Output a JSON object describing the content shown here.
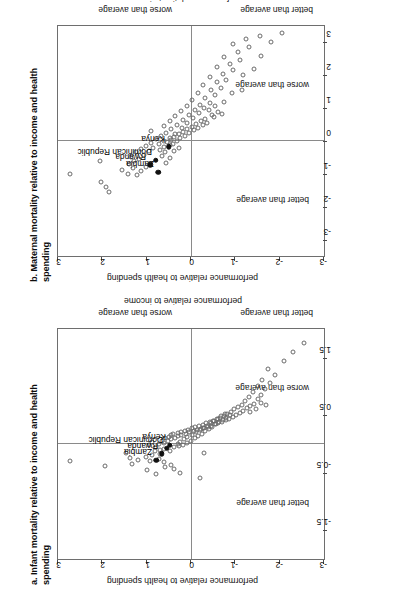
{
  "figure": {
    "orientation": "rotated-90-ccw",
    "background": "#ffffff",
    "point_stroke": "#6b6b6b",
    "highlight_fill": "#111111",
    "axis_color": "#6e6e6e"
  },
  "chart_data": [
    {
      "type": "scatter",
      "id": "panel-a",
      "title": "a. Infant mortality relative to income and health spending",
      "xlabel": "performance relative to income",
      "ylabel": "performance relative to health spending",
      "xlim": [
        -2.0,
        2.0
      ],
      "ylim": [
        -3.0,
        3.0
      ],
      "xticks": [
        -1.5,
        -0.5,
        0.5,
        1.5
      ],
      "xticklabels": [
        "-1.5",
        "-0.5",
        "0.5",
        "1.5"
      ],
      "yticks": [
        -3,
        -2,
        -1,
        0,
        1,
        2,
        3
      ],
      "yticklabels": [
        "-3",
        "-2",
        "-1",
        "0",
        "1",
        "2",
        "3"
      ],
      "grid": false,
      "zero_lines": true,
      "quadrant_notes": {
        "x_negative": "better than average",
        "x_positive": "worse than average",
        "y_negative": "better than average",
        "y_positive": "worse than average"
      },
      "highlighted": [
        {
          "label": "Zambia",
          "x": -0.28,
          "y": 0.78
        },
        {
          "label": "Rwanda",
          "x": -0.17,
          "y": 0.66
        },
        {
          "label": "Dominican Republic",
          "x": -0.07,
          "y": 0.55
        },
        {
          "label": "Kenya",
          "x": -0.02,
          "y": 0.48
        }
      ],
      "points": [
        [
          -0.3,
          2.72
        ],
        [
          -0.38,
          1.93
        ],
        [
          -0.16,
          1.46
        ],
        [
          -0.24,
          1.38
        ],
        [
          -0.34,
          1.33
        ],
        [
          -0.28,
          1.2
        ],
        [
          -0.45,
          1.0
        ],
        [
          -0.52,
          0.8
        ],
        [
          -0.3,
          0.93
        ],
        [
          -0.22,
          1.02
        ],
        [
          -0.2,
          0.88
        ],
        [
          -0.26,
          0.72
        ],
        [
          -0.18,
          0.7
        ],
        [
          -0.13,
          0.82
        ],
        [
          -0.1,
          0.7
        ],
        [
          -0.08,
          0.6
        ],
        [
          -0.05,
          0.8
        ],
        [
          -0.02,
          0.95
        ],
        [
          0.0,
          0.72
        ],
        [
          0.02,
          0.6
        ],
        [
          0.03,
          0.88
        ],
        [
          0.05,
          0.52
        ],
        [
          0.06,
          0.66
        ],
        [
          0.08,
          0.44
        ],
        [
          0.1,
          0.58
        ],
        [
          0.11,
          0.36
        ],
        [
          0.12,
          0.5
        ],
        [
          0.14,
          0.3
        ],
        [
          0.15,
          0.44
        ],
        [
          0.16,
          0.22
        ],
        [
          0.17,
          0.4
        ],
        [
          0.18,
          0.12
        ],
        [
          0.19,
          0.3
        ],
        [
          0.2,
          0.04
        ],
        [
          0.21,
          0.22
        ],
        [
          0.22,
          -0.06
        ],
        [
          0.23,
          0.14
        ],
        [
          0.24,
          -0.14
        ],
        [
          0.25,
          0.06
        ],
        [
          0.26,
          -0.22
        ],
        [
          0.27,
          -0.02
        ],
        [
          0.28,
          -0.3
        ],
        [
          0.29,
          -0.1
        ],
        [
          0.3,
          -0.38
        ],
        [
          0.31,
          -0.18
        ],
        [
          0.32,
          -0.46
        ],
        [
          0.33,
          -0.26
        ],
        [
          0.34,
          -0.54
        ],
        [
          0.36,
          -0.34
        ],
        [
          0.37,
          -0.62
        ],
        [
          0.38,
          -0.42
        ],
        [
          0.39,
          -0.7
        ],
        [
          0.4,
          -0.5
        ],
        [
          0.41,
          -0.78
        ],
        [
          0.43,
          -0.58
        ],
        [
          0.44,
          -0.86
        ],
        [
          0.45,
          -0.66
        ],
        [
          0.47,
          -0.94
        ],
        [
          0.48,
          -0.74
        ],
        [
          0.5,
          -1.02
        ],
        [
          0.52,
          -0.82
        ],
        [
          0.54,
          -1.1
        ],
        [
          0.56,
          -0.9
        ],
        [
          0.58,
          -1.18
        ],
        [
          0.6,
          -0.98
        ],
        [
          0.62,
          -1.26
        ],
        [
          0.64,
          -1.06
        ],
        [
          0.66,
          -1.34
        ],
        [
          0.68,
          -1.14
        ],
        [
          0.7,
          -1.42
        ],
        [
          0.74,
          -1.22
        ],
        [
          0.78,
          -1.5
        ],
        [
          0.82,
          -1.3
        ],
        [
          0.86,
          -1.58
        ],
        [
          0.9,
          -1.4
        ],
        [
          0.95,
          -1.66
        ],
        [
          1.0,
          -1.5
        ],
        [
          1.06,
          -1.78
        ],
        [
          1.12,
          -1.6
        ],
        [
          1.2,
          -1.9
        ],
        [
          1.3,
          -1.74
        ],
        [
          1.45,
          -2.1
        ],
        [
          1.6,
          -2.3
        ],
        [
          1.75,
          -2.55
        ],
        [
          -0.06,
          0.38
        ],
        [
          -0.04,
          0.26
        ],
        [
          -0.02,
          0.18
        ],
        [
          0.0,
          0.3
        ],
        [
          0.02,
          0.1
        ],
        [
          0.04,
          0.24
        ],
        [
          0.06,
          0.0
        ],
        [
          0.08,
          0.16
        ],
        [
          0.1,
          -0.08
        ],
        [
          0.12,
          0.08
        ],
        [
          0.14,
          -0.16
        ],
        [
          0.16,
          -0.02
        ],
        [
          0.18,
          -0.24
        ],
        [
          0.2,
          -0.12
        ],
        [
          0.22,
          -0.32
        ],
        [
          0.24,
          -0.2
        ],
        [
          0.26,
          -0.4
        ],
        [
          0.28,
          -0.28
        ],
        [
          0.3,
          -0.48
        ],
        [
          0.32,
          -0.36
        ],
        [
          0.34,
          -0.56
        ],
        [
          0.36,
          -0.44
        ],
        [
          0.38,
          -0.64
        ],
        [
          0.4,
          -0.52
        ],
        [
          0.42,
          -0.72
        ],
        [
          0.44,
          -0.6
        ],
        [
          0.46,
          -0.8
        ],
        [
          0.48,
          -0.68
        ],
        [
          0.5,
          -0.88
        ],
        [
          0.52,
          -0.76
        ],
        [
          -0.4,
          0.58
        ],
        [
          -0.36,
          0.46
        ],
        [
          -0.32,
          0.62
        ],
        [
          -0.12,
          0.48
        ],
        [
          -0.44,
          0.38
        ],
        [
          -0.5,
          0.25
        ],
        [
          -0.6,
          -0.2
        ],
        [
          -0.15,
          -0.3
        ],
        [
          0.55,
          -1.34
        ],
        [
          0.6,
          -1.46
        ],
        [
          0.68,
          -1.7
        ],
        [
          0.72,
          -1.58
        ]
      ]
    },
    {
      "type": "scatter",
      "id": "panel-b",
      "title": "b. Maternal mortality relative to income and health spending",
      "xlabel": "performance relative to income",
      "ylabel": "performance relative to health spending",
      "xlim": [
        -3.5,
        3.5
      ],
      "ylim": [
        -3.0,
        3.0
      ],
      "xticks": [
        -3,
        -2,
        -1,
        0,
        1,
        2,
        3
      ],
      "xticklabels": [
        "-3",
        "-2",
        "-1",
        "0",
        "1",
        "2",
        "3"
      ],
      "yticks": [
        -3,
        -2,
        -1,
        0,
        1,
        2,
        3
      ],
      "yticklabels": [
        "-3",
        "-2",
        "-1",
        "0",
        "1",
        "2",
        "3"
      ],
      "grid": false,
      "zero_lines": true,
      "quadrant_notes": {
        "x_negative": "better than average",
        "x_positive": "worse than average",
        "y_negative": "better than average",
        "y_positive": "worse than average"
      },
      "highlighted": [
        {
          "label": "Zambia",
          "x": -0.95,
          "y": 0.74
        },
        {
          "label": "Rwanda",
          "x": -0.72,
          "y": 0.92
        },
        {
          "label": "Dominican Republic",
          "x": -0.58,
          "y": 0.8
        },
        {
          "label": "Kenya",
          "x": -0.18,
          "y": 0.5
        }
      ],
      "points": [
        [
          -1.0,
          2.72
        ],
        [
          -1.25,
          2.02
        ],
        [
          -1.4,
          1.92
        ],
        [
          -1.55,
          1.85
        ],
        [
          -0.6,
          2.06
        ],
        [
          -0.88,
          1.55
        ],
        [
          -1.0,
          1.42
        ],
        [
          -0.82,
          1.3
        ],
        [
          -1.05,
          1.22
        ],
        [
          -0.92,
          1.12
        ],
        [
          -0.7,
          1.4
        ],
        [
          -0.62,
          1.28
        ],
        [
          -0.78,
          1.02
        ],
        [
          -0.55,
          1.18
        ],
        [
          -0.48,
          1.35
        ],
        [
          -0.42,
          1.05
        ],
        [
          -0.35,
          1.24
        ],
        [
          -0.3,
          0.95
        ],
        [
          -0.25,
          1.12
        ],
        [
          -0.2,
          0.85
        ],
        [
          -0.15,
          1.02
        ],
        [
          -0.1,
          0.72
        ],
        [
          -0.05,
          0.9
        ],
        [
          0.0,
          0.6
        ],
        [
          0.05,
          0.8
        ],
        [
          0.1,
          0.48
        ],
        [
          0.15,
          0.68
        ],
        [
          0.2,
          0.36
        ],
        [
          0.25,
          0.56
        ],
        [
          0.3,
          0.9
        ],
        [
          0.35,
          0.44
        ],
        [
          0.4,
          0.2
        ],
        [
          0.45,
          0.62
        ],
        [
          0.5,
          0.32
        ],
        [
          0.55,
          0.08
        ],
        [
          0.6,
          0.48
        ],
        [
          0.65,
          0.18
        ],
        [
          0.7,
          -0.05
        ],
        [
          0.75,
          0.36
        ],
        [
          0.8,
          0.05
        ],
        [
          0.85,
          -0.18
        ],
        [
          0.9,
          0.22
        ],
        [
          0.95,
          -0.08
        ],
        [
          1.0,
          -0.3
        ],
        [
          1.05,
          0.1
        ],
        [
          1.1,
          -0.2
        ],
        [
          1.15,
          -0.42
        ],
        [
          1.25,
          -0.02
        ],
        [
          1.3,
          -0.32
        ],
        [
          1.4,
          -0.55
        ],
        [
          1.45,
          -0.15
        ],
        [
          1.55,
          -0.45
        ],
        [
          1.6,
          -0.68
        ],
        [
          1.7,
          -0.28
        ],
        [
          1.8,
          -0.58
        ],
        [
          1.85,
          -0.8
        ],
        [
          1.95,
          -0.42
        ],
        [
          2.05,
          -0.72
        ],
        [
          2.15,
          -0.95
        ],
        [
          2.25,
          -0.58
        ],
        [
          2.35,
          -0.88
        ],
        [
          2.45,
          -1.1
        ],
        [
          2.55,
          -0.75
        ],
        [
          2.7,
          -1.05
        ],
        [
          2.85,
          -1.3
        ],
        [
          2.95,
          -0.95
        ],
        [
          3.1,
          -1.25
        ],
        [
          3.2,
          -1.55
        ],
        [
          1.45,
          -0.92
        ],
        [
          1.55,
          -1.15
        ],
        [
          1.2,
          -0.75
        ],
        [
          1.05,
          -0.55
        ],
        [
          0.95,
          -0.4
        ],
        [
          0.88,
          -0.62
        ],
        [
          0.78,
          -0.48
        ],
        [
          -0.18,
          0.62
        ],
        [
          -0.12,
          0.48
        ],
        [
          -0.08,
          0.4
        ],
        [
          -0.04,
          0.55
        ],
        [
          0.0,
          0.32
        ],
        [
          0.04,
          0.46
        ],
        [
          0.08,
          0.24
        ],
        [
          0.12,
          0.38
        ],
        [
          0.16,
          0.14
        ],
        [
          0.2,
          0.28
        ],
        [
          0.24,
          0.04
        ],
        [
          0.28,
          0.18
        ],
        [
          0.32,
          -0.06
        ],
        [
          0.36,
          0.08
        ],
        [
          0.4,
          -0.16
        ],
        [
          0.44,
          -0.02
        ],
        [
          0.48,
          -0.26
        ],
        [
          0.52,
          -0.12
        ],
        [
          0.56,
          -0.36
        ],
        [
          0.6,
          -0.22
        ],
        [
          -0.26,
          0.7
        ],
        [
          -0.34,
          0.58
        ],
        [
          -0.45,
          0.66
        ],
        [
          -0.52,
          0.48
        ],
        [
          -0.66,
          0.56
        ],
        [
          -0.22,
          0.28
        ],
        [
          -0.3,
          0.38
        ],
        [
          0.68,
          -0.32
        ],
        [
          0.74,
          -0.52
        ],
        [
          0.82,
          -0.7
        ],
        [
          2.0,
          -1.18
        ],
        [
          2.2,
          -1.42
        ],
        [
          2.6,
          -1.58
        ],
        [
          3.0,
          -1.8
        ],
        [
          3.3,
          -2.05
        ]
      ]
    }
  ]
}
